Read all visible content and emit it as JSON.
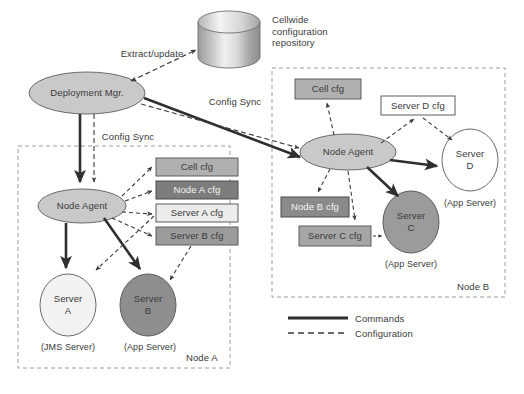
{
  "diagram": {
    "background": "#ffffff",
    "legend": {
      "items": [
        {
          "label": "Commands",
          "style": "solid",
          "color": "#3a3a3a"
        },
        {
          "label": "Configuration",
          "style": "dashed",
          "color": "#3a3a3a"
        }
      ]
    },
    "repository": {
      "name": "cellwide-config-repository",
      "label": "Cellwide\nconfiguration\nrepository",
      "shape": "cylinder",
      "fill_light": "#f2f2f2",
      "fill_dark": "#8e8e8e"
    },
    "nodes": {
      "deployment_manager": {
        "label": "Deployment Mgr.",
        "shape": "ellipse",
        "fill": "#c9c9c9"
      },
      "node_agent_a": {
        "label": "Node Agent",
        "shape": "ellipse",
        "fill": "#c9c9c9"
      },
      "node_agent_b": {
        "label": "Node Agent",
        "shape": "ellipse",
        "fill": "#c9c9c9"
      }
    },
    "regions": [
      {
        "id": "node-a",
        "label": "Node A",
        "border": "dashed"
      },
      {
        "id": "node-b",
        "label": "Node B",
        "border": "dashed"
      }
    ],
    "config_boxes": [
      {
        "id": "cell-cfg-a",
        "label": "Cell cfg",
        "fill": "#b0b0b0"
      },
      {
        "id": "node-a-cfg",
        "label": "Node A cfg",
        "fill": "#7d7d7d"
      },
      {
        "id": "server-a-cfg",
        "label": "Server A cfg",
        "fill": "#ececec"
      },
      {
        "id": "server-b-cfg",
        "label": "Server B cfg",
        "fill": "#9c9c9c"
      },
      {
        "id": "cell-cfg-b",
        "label": "Cell cfg",
        "fill": "#b0b0b0"
      },
      {
        "id": "server-d-cfg",
        "label": "Server D cfg",
        "fill": "#ffffff"
      },
      {
        "id": "node-b-cfg",
        "label": "Node B cfg",
        "fill": "#8a8a8a"
      },
      {
        "id": "server-c-cfg",
        "label": "Server C cfg",
        "fill": "#a6a6a6"
      }
    ],
    "servers": [
      {
        "id": "server-a",
        "name": "Server\nA",
        "name_line1": "Server",
        "name_line2": "A",
        "caption": "(JMS Server)",
        "fill": "#f2f2f2"
      },
      {
        "id": "server-b",
        "name": "Server\nB",
        "name_line1": "Server",
        "name_line2": "B",
        "caption": "(App Server)",
        "fill": "#8e8e8e"
      },
      {
        "id": "server-c",
        "name": "Server\nC",
        "name_line1": "Server",
        "name_line2": "C",
        "caption": "(App Server)",
        "fill": "#9b9b9b"
      },
      {
        "id": "server-d",
        "name": "Server\nD",
        "name_line1": "Server",
        "name_line2": "D",
        "caption": "(App Server)",
        "fill": "#ffffff"
      }
    ],
    "edge_labels": [
      {
        "id": "extract-update",
        "label": "Extract/update"
      },
      {
        "id": "config-sync-right",
        "label": "Config Sync"
      },
      {
        "id": "config-sync-down",
        "label": "Config Sync"
      }
    ]
  }
}
